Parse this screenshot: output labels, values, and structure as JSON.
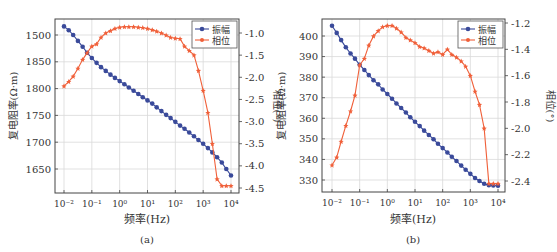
{
  "chart_data": [
    {
      "panel": "(a)",
      "type": "line",
      "xlabel": "频率(Hz)",
      "ylabel_left": "复电阻率(Ω·m)",
      "ylabel_right": "相位(°)",
      "x_scale": "log",
      "x_tick_labels": [
        "10⁻²",
        "10⁻¹",
        "10⁰",
        "10¹",
        "10²",
        "10³",
        "10⁴"
      ],
      "y_left_ticks": [
        1650,
        1700,
        1750,
        1800,
        1850,
        1900
      ],
      "y_left_tick_labels": [
        "1650",
        "1700",
        "1750",
        "1800",
        "1850",
        "1500"
      ],
      "y_right_ticks": [
        -4.5,
        -4.0,
        -3.5,
        -3.0,
        -2.5,
        -2.0,
        -1.5,
        -1.0
      ],
      "y_right_tick_labels": [
        "-4.5",
        "-4.0",
        "-3.5",
        "-3.0",
        "-2.5",
        "-2.0",
        "-1.5",
        "-1.0"
      ],
      "grid": true,
      "legend": {
        "position": "upper right",
        "entries": [
          "振幅",
          "相位"
        ]
      },
      "series": [
        {
          "name": "振幅",
          "axis": "left",
          "color": "#3a4a9a",
          "marker": "circle",
          "log10_x": [
            -2,
            -1.83,
            -1.67,
            -1.5,
            -1.33,
            -1.17,
            -1,
            -0.83,
            -0.67,
            -0.5,
            -0.33,
            -0.17,
            0,
            0.17,
            0.33,
            0.5,
            0.67,
            0.83,
            1,
            1.17,
            1.33,
            1.5,
            1.67,
            1.83,
            2,
            2.17,
            2.33,
            2.5,
            2.67,
            2.83,
            3,
            3.17,
            3.33,
            3.5,
            3.67,
            3.83,
            4
          ],
          "values": [
            1916,
            1909,
            1900,
            1889,
            1878,
            1867,
            1857,
            1848,
            1840,
            1833,
            1826,
            1820,
            1814,
            1808,
            1802,
            1796,
            1790,
            1784,
            1778,
            1772,
            1765,
            1758,
            1751,
            1745,
            1738,
            1731,
            1725,
            1718,
            1711,
            1704,
            1697,
            1689,
            1681,
            1672,
            1662,
            1650,
            1638
          ]
        },
        {
          "name": "相位",
          "axis": "right",
          "color": "#f0603a",
          "marker": "star",
          "log10_x": [
            -2,
            -1.83,
            -1.67,
            -1.5,
            -1.33,
            -1.17,
            -1,
            -0.83,
            -0.67,
            -0.5,
            -0.33,
            -0.17,
            0,
            0.17,
            0.33,
            0.5,
            0.67,
            0.83,
            1,
            1.17,
            1.33,
            1.5,
            1.67,
            1.83,
            2,
            2.17,
            2.33,
            2.5,
            2.67,
            2.83,
            3,
            3.17,
            3.33,
            3.5,
            3.67,
            3.83,
            4
          ],
          "values": [
            -2.2,
            -2.1,
            -1.98,
            -1.8,
            -1.6,
            -1.45,
            -1.3,
            -1.25,
            -1.1,
            -1.0,
            -0.95,
            -0.9,
            -0.87,
            -0.86,
            -0.86,
            -0.86,
            -0.87,
            -0.88,
            -0.9,
            -0.93,
            -0.96,
            -1.0,
            -1.05,
            -1.1,
            -1.12,
            -1.13,
            -1.3,
            -1.4,
            -1.5,
            -1.85,
            -2.3,
            -2.8,
            -3.5,
            -4.3,
            -4.45,
            -4.45,
            -4.45
          ]
        }
      ]
    },
    {
      "panel": "(b)",
      "type": "line",
      "xlabel": "频率(Hz)",
      "ylabel_left": "复电阻率(Ω·m)",
      "ylabel_right": "相位(°)",
      "x_scale": "log",
      "x_tick_labels": [
        "10⁻²",
        "10⁻¹",
        "10⁰",
        "10¹",
        "10²",
        "10³",
        "10⁴"
      ],
      "y_left_ticks": [
        330,
        340,
        350,
        360,
        370,
        380,
        390,
        400
      ],
      "y_left_tick_labels": [
        "330",
        "340",
        "350",
        "360",
        "370",
        "380",
        "390",
        "400"
      ],
      "y_right_ticks": [
        -2.4,
        -2.2,
        -2.0,
        -1.8,
        -1.6,
        -1.4,
        -1.2
      ],
      "y_right_tick_labels": [
        "-2.4",
        "-2.2",
        "-2.0",
        "-1.8",
        "-1.6",
        "-1.4",
        "-1.2"
      ],
      "grid": true,
      "legend": {
        "position": "upper right",
        "entries": [
          "振幅",
          "相位"
        ]
      },
      "series": [
        {
          "name": "振幅",
          "axis": "left",
          "color": "#3a4a9a",
          "marker": "circle",
          "log10_x": [
            -2,
            -1.83,
            -1.67,
            -1.5,
            -1.33,
            -1.17,
            -1,
            -0.83,
            -0.67,
            -0.5,
            -0.33,
            -0.17,
            0,
            0.17,
            0.33,
            0.5,
            0.67,
            0.83,
            1,
            1.17,
            1.33,
            1.5,
            1.67,
            1.83,
            2,
            2.17,
            2.33,
            2.5,
            2.67,
            2.83,
            3,
            3.17,
            3.33,
            3.5,
            3.67,
            3.83,
            4
          ],
          "values": [
            405,
            401.5,
            398,
            394.5,
            391.5,
            389,
            386,
            383.5,
            381,
            378.5,
            376.5,
            374,
            371.8,
            369.5,
            367.2,
            365,
            362.8,
            360.5,
            358.3,
            356.2,
            354,
            351.9,
            349.8,
            347.6,
            345.5,
            343.4,
            341.3,
            339.2,
            337,
            335,
            333,
            331,
            329.5,
            328.2,
            327.5,
            327.3,
            327.2
          ]
        },
        {
          "name": "相位",
          "axis": "right",
          "color": "#f0603a",
          "marker": "star",
          "log10_x": [
            -2,
            -1.83,
            -1.67,
            -1.5,
            -1.33,
            -1.17,
            -1,
            -0.83,
            -0.67,
            -0.5,
            -0.33,
            -0.17,
            0,
            0.17,
            0.33,
            0.5,
            0.67,
            0.83,
            1,
            1.17,
            1.33,
            1.5,
            1.67,
            1.83,
            2,
            2.17,
            2.33,
            2.5,
            2.67,
            2.83,
            3,
            3.17,
            3.33,
            3.5,
            3.67,
            3.83,
            4
          ],
          "values": [
            -2.28,
            -2.22,
            -2.1,
            -1.98,
            -1.87,
            -1.75,
            -1.52,
            -1.47,
            -1.37,
            -1.3,
            -1.26,
            -1.23,
            -1.22,
            -1.22,
            -1.24,
            -1.27,
            -1.31,
            -1.33,
            -1.35,
            -1.38,
            -1.39,
            -1.41,
            -1.43,
            -1.42,
            -1.44,
            -1.4,
            -1.44,
            -1.46,
            -1.49,
            -1.53,
            -1.6,
            -1.72,
            -1.82,
            -2.0,
            -2.42,
            -2.42,
            -2.42
          ]
        }
      ]
    }
  ]
}
